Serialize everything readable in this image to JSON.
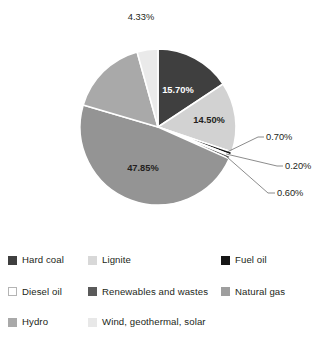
{
  "chart_data": {
    "type": "pie",
    "title": "",
    "subtitle": "",
    "xlabel": "",
    "ylabel": "",
    "legend_position": "bottom",
    "grid": false,
    "unit": "%",
    "start_angle_deg": 0,
    "direction": "clockwise",
    "categories": [
      "Hard coal",
      "Lignite",
      "Fuel oil",
      "Diesel oil",
      "Renewables and wastes",
      "Natural gas",
      "Hydro",
      "Wind, geothermal, solar"
    ],
    "values": [
      15.7,
      14.5,
      0.7,
      0.2,
      0.6,
      47.85,
      16.12,
      4.33
    ],
    "labels": [
      "15.70%",
      "14.50%",
      "0.70%",
      "0.20%",
      "0.60%",
      "47.85%",
      "",
      "4.33%"
    ],
    "colors": [
      "#3f3f3f",
      "#d2d2d2",
      "#161616",
      "#ffffff",
      "#5a5a5a",
      "#949494",
      "#a9a9a9",
      "#eaeaea"
    ],
    "label_text_colors": [
      "#ffffff",
      "#231f20",
      "#231f20",
      "#231f20",
      "#231f20",
      "#231f20",
      "#231f20",
      "#231f20"
    ],
    "callout_slices": [
      "Fuel oil",
      "Diesel oil",
      "Renewables and wastes"
    ],
    "inside_labels": [
      "15.70%",
      "14.50%",
      "47.85%"
    ],
    "outside_labels": [
      "4.33%",
      "0.70%",
      "0.20%",
      "0.60%"
    ]
  },
  "pie": {
    "center_x": 158,
    "center_y": 127,
    "radius": 78,
    "slice_gap_color": "#ffffff",
    "slice_gap_width": 1.6,
    "labels": {
      "hard_coal": "15.70%",
      "lignite": "14.50%",
      "natural_gas": "47.85%",
      "wind": "4.33%",
      "fuel_oil": "0.70%",
      "diesel_oil": "0.20%",
      "renewables": "0.60%"
    }
  },
  "legend": {
    "items": [
      {
        "label": "Hard coal",
        "color": "#3f3f3f",
        "border": "none",
        "swatch_name": "legend-swatch-hard-coal"
      },
      {
        "label": "Lignite",
        "color": "#d8d8d8",
        "border": "none",
        "swatch_name": "legend-swatch-lignite"
      },
      {
        "label": "Fuel oil",
        "color": "#161616",
        "border": "none",
        "swatch_name": "legend-swatch-fuel-oil"
      },
      {
        "label": "Diesel oil",
        "color": "#ffffff",
        "border": "#b4b4b4",
        "swatch_name": "legend-swatch-diesel-oil"
      },
      {
        "label": "Renewables and wastes",
        "color": "#5a5a5a",
        "border": "none",
        "swatch_name": "legend-swatch-renewables"
      },
      {
        "label": "Natural gas",
        "color": "#9e9e9e",
        "border": "none",
        "swatch_name": "legend-swatch-natural-gas"
      },
      {
        "label": "Hydro",
        "color": "#a9a9a9",
        "border": "none",
        "swatch_name": "legend-swatch-hydro"
      },
      {
        "label": "Wind, geothermal, solar",
        "color": "#e8e8e8",
        "border": "none",
        "swatch_name": "legend-swatch-wind"
      }
    ]
  }
}
